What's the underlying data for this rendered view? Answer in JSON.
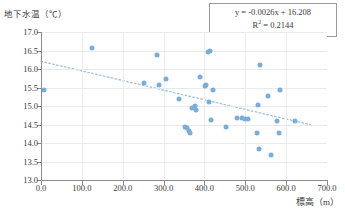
{
  "chart_data": {
    "type": "scatter",
    "title": "",
    "xlabel": "標高（m）",
    "ylabel": "地下水温（℃）",
    "xlim": [
      0.0,
      700.0
    ],
    "ylim": [
      13.0,
      17.0
    ],
    "xticks": [
      "0.0",
      "100.0",
      "200.0",
      "300.0",
      "400.0",
      "500.0",
      "600.0",
      "700.0"
    ],
    "xtick_values": [
      0,
      100,
      200,
      300,
      400,
      500,
      600,
      700
    ],
    "yticks": [
      "13.0",
      "13.5",
      "14.0",
      "14.5",
      "15.0",
      "15.5",
      "16.0",
      "16.5",
      "17.0"
    ],
    "ytick_values": [
      13.0,
      13.5,
      14.0,
      14.5,
      15.0,
      15.5,
      16.0,
      16.5,
      17.0
    ],
    "grid": true,
    "legend": "none",
    "marker_color": "#7aadd9",
    "trendline_color": "#9cc3e3",
    "trendline_style": "dotted",
    "annotations": {
      "equation": "y = -0.0026x + 16.208",
      "r_squared_label": "R",
      "r_squared_sup": "2",
      "r_squared_value": " = 0.2144"
    },
    "trendline": {
      "slope": -0.0026,
      "intercept": 16.208,
      "x_start": 0,
      "x_end": 660
    },
    "points": [
      {
        "x": 8,
        "y": 15.42
      },
      {
        "x": 125,
        "y": 16.56
      },
      {
        "x": 252,
        "y": 15.62
      },
      {
        "x": 283,
        "y": 16.37
      },
      {
        "x": 288,
        "y": 15.58
      },
      {
        "x": 305,
        "y": 15.74
      },
      {
        "x": 338,
        "y": 15.2
      },
      {
        "x": 352,
        "y": 14.43
      },
      {
        "x": 357,
        "y": 14.4
      },
      {
        "x": 362,
        "y": 14.33
      },
      {
        "x": 364,
        "y": 14.28
      },
      {
        "x": 370,
        "y": 14.95
      },
      {
        "x": 378,
        "y": 14.99
      },
      {
        "x": 380,
        "y": 14.9
      },
      {
        "x": 388,
        "y": 15.78
      },
      {
        "x": 402,
        "y": 15.53
      },
      {
        "x": 405,
        "y": 15.56
      },
      {
        "x": 408,
        "y": 16.45
      },
      {
        "x": 414,
        "y": 16.49
      },
      {
        "x": 412,
        "y": 15.12
      },
      {
        "x": 416,
        "y": 14.62
      },
      {
        "x": 422,
        "y": 15.44
      },
      {
        "x": 452,
        "y": 14.43
      },
      {
        "x": 480,
        "y": 14.68
      },
      {
        "x": 492,
        "y": 14.68
      },
      {
        "x": 500,
        "y": 14.65
      },
      {
        "x": 506,
        "y": 14.65
      },
      {
        "x": 528,
        "y": 14.28
      },
      {
        "x": 532,
        "y": 15.03
      },
      {
        "x": 534,
        "y": 13.85
      },
      {
        "x": 537,
        "y": 16.11
      },
      {
        "x": 556,
        "y": 15.28
      },
      {
        "x": 562,
        "y": 13.68
      },
      {
        "x": 578,
        "y": 14.6
      },
      {
        "x": 583,
        "y": 14.28
      },
      {
        "x": 586,
        "y": 15.44
      },
      {
        "x": 622,
        "y": 14.59
      }
    ]
  }
}
